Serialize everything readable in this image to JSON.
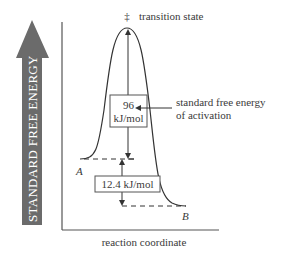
{
  "diagram": {
    "type": "reaction-energy-diagram",
    "y_axis_label": "STANDARD FREE ENERGY",
    "x_axis_label": "reaction coordinate",
    "transition_state": {
      "symbol": "‡",
      "label": "transition state"
    },
    "activation_energy": {
      "value": "96",
      "unit": "kJ/mol",
      "callout_line1": "standard free energy",
      "callout_line2": "of activation"
    },
    "reaction_energy": {
      "value_label": "12.4 kJ/mol"
    },
    "states": [
      {
        "name": "A",
        "role": "reactant"
      },
      {
        "name": "B",
        "role": "product"
      }
    ],
    "colors": {
      "arrow_fill": "#6b6b6b",
      "arrow_text": "#ffffff",
      "line": "#333333",
      "axis": "#555555",
      "text": "#3a3a3a"
    }
  }
}
